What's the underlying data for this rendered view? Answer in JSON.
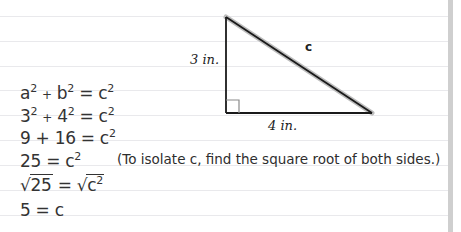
{
  "diagram": {
    "triangle": {
      "side_vertical_label": "3 in.",
      "side_horizontal_label": "4 in.",
      "hypotenuse_label": "c",
      "right_angle_marker": true,
      "vertices": {
        "top": [
          226,
          17
        ],
        "corner": [
          226,
          113
        ],
        "right": [
          372,
          113
        ]
      },
      "stroke_color": "#1a1a1a",
      "hypotenuse_highlight_color": "#b8b8b8"
    },
    "equations": [
      {
        "lhs": "a",
        "lhs_exp": "2",
        "op": "+",
        "rhs": "b",
        "rhs_exp": "2",
        "eq": "= c",
        "eq_exp": "2"
      },
      {
        "lhs": "3",
        "lhs_exp": "2",
        "op": "+",
        "rhs": "4",
        "rhs_exp": "2",
        "eq": "= c",
        "eq_exp": "2"
      },
      {
        "text": "9 + 16 = c",
        "exp": "2"
      },
      {
        "text": "25 = c",
        "exp": "2"
      },
      {
        "sqrt_left": "25",
        "equals": "=",
        "sqrt_right": "c",
        "sqrt_right_exp": "2"
      },
      {
        "text": "5 = c"
      }
    ],
    "note": "(To isolate c, find the square root of both sides.)"
  },
  "colors": {
    "background": "#ffffff",
    "rule_lines": "#e9e9ec",
    "margin_bar": "#cfcfcf",
    "text": "#333333"
  }
}
